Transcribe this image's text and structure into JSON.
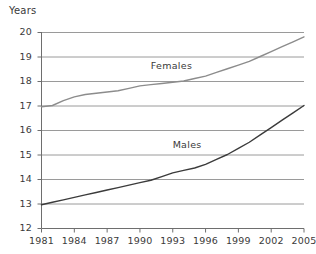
{
  "chart_data": {
    "type": "line",
    "title": "",
    "ylabel": "Years",
    "xlabel": "",
    "ylim": [
      12,
      20
    ],
    "xlim": [
      1981,
      2005
    ],
    "grid": true,
    "legend_position": "inline-annotations",
    "y_ticks": [
      "20",
      "19",
      "18",
      "17",
      "16",
      "15",
      "14",
      "13",
      "12"
    ],
    "x_ticks": [
      "1981",
      "1984",
      "1987",
      "1990",
      "1993",
      "1996",
      "1999",
      "2002",
      "2005"
    ],
    "x": [
      1981,
      1982,
      1983,
      1984,
      1985,
      1986,
      1987,
      1988,
      1989,
      1990,
      1991,
      1992,
      1993,
      1994,
      1995,
      1996,
      1997,
      1998,
      1999,
      2000,
      2001,
      2002,
      2003,
      2004,
      2005
    ],
    "series": [
      {
        "name": "Females",
        "color": "#8c8c8c",
        "values": [
          16.95,
          17.0,
          17.2,
          17.35,
          17.45,
          17.5,
          17.55,
          17.6,
          17.7,
          17.8,
          17.85,
          17.9,
          17.95,
          18.0,
          18.1,
          18.2,
          18.35,
          18.5,
          18.65,
          18.8,
          19.0,
          19.2,
          19.4,
          19.6,
          19.8
        ]
      },
      {
        "name": "Males",
        "color": "#3b3b3b",
        "values": [
          12.95,
          13.05,
          13.15,
          13.25,
          13.35,
          13.45,
          13.55,
          13.65,
          13.75,
          13.85,
          13.95,
          14.1,
          14.25,
          14.35,
          14.45,
          14.6,
          14.8,
          15.0,
          15.25,
          15.5,
          15.8,
          16.1,
          16.4,
          16.7,
          17.0
        ]
      }
    ],
    "annotations": [
      {
        "text": "Females",
        "x": 1993,
        "y": 18.6
      },
      {
        "text": "Males",
        "x": 1995,
        "y": 15.4
      }
    ],
    "colors": {
      "grid": "#9a9a9a",
      "axis": "#6e6e6e",
      "text": "#3a3a3a",
      "background": "#ffffff"
    }
  }
}
